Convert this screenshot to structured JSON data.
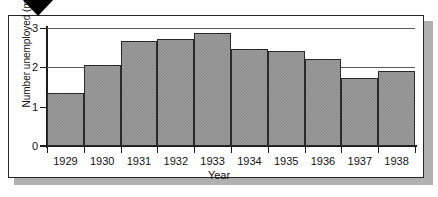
{
  "scan": {
    "top_clipped_text": "",
    "marker_icon": "triangle-down-marker"
  },
  "chart_data": {
    "type": "bar",
    "title": "",
    "xlabel": "Year",
    "ylabel": "Number unemployed (millions)",
    "categories": [
      "1929",
      "1930",
      "1931",
      "1932",
      "1933",
      "1934",
      "1935",
      "1936",
      "1937",
      "1938"
    ],
    "values": [
      1.35,
      2.07,
      2.67,
      2.72,
      2.87,
      2.47,
      2.42,
      2.2,
      1.72,
      1.9
    ],
    "ylim": [
      0,
      3.0
    ],
    "yticks": [
      "0",
      "1",
      "2",
      "3"
    ],
    "ytick_values": [
      0,
      1,
      2,
      3
    ],
    "grid": "horizontal",
    "legend": "none",
    "bar_fill": "#9b9b9b",
    "bar_outline": "#2a2a2a",
    "axis_color": "#1a1a1a",
    "gridline_color": "#5a5a5a"
  }
}
